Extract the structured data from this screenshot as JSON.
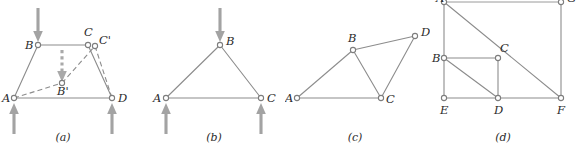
{
  "figure": {
    "kind": "statics-free-body-diagrams",
    "colors": {
      "line": "#8c8c8c",
      "node_stroke": "#7d7d7d",
      "node_fill": "#ffffff",
      "arrow": "#a3a3a3",
      "dashed_arrow": "#a9a9a9",
      "label": "#2b2b2b",
      "background": "#ffffff"
    },
    "panels": [
      {
        "id": "a",
        "caption": "(a)",
        "description": "Deformable quadrilateral frame ABCD with dashed deformed shape AB'C'D",
        "vertices": [
          {
            "name": "A",
            "label": "A",
            "x": 14,
            "y": 98
          },
          {
            "name": "B",
            "label": "B",
            "x": 38,
            "y": 45
          },
          {
            "name": "C",
            "label": "C",
            "x": 88,
            "y": 45
          },
          {
            "name": "D",
            "label": "D",
            "x": 112,
            "y": 98
          },
          {
            "name": "Bp",
            "label": "B'",
            "x": 62,
            "y": 83
          },
          {
            "name": "Cp",
            "label": "C'",
            "x": 95,
            "y": 45
          }
        ],
        "solid_edges": [
          "A-B",
          "B-C",
          "C-D",
          "A-D"
        ],
        "dashed_edges": [
          "A-Bp",
          "Bp-Cp",
          "Cp-D"
        ],
        "load_arrows": [
          {
            "name": "top-load-at-B",
            "direction": "down",
            "x": 38,
            "y_from": 8,
            "y_to": 40
          },
          {
            "name": "support-at-A",
            "direction": "up",
            "x": 14,
            "y_from": 134,
            "y_to": 103
          },
          {
            "name": "support-at-D",
            "direction": "up",
            "x": 112,
            "y_from": 134,
            "y_to": 103
          }
        ],
        "dashed_arrows": [
          {
            "name": "deflection-arrow-B-to-Bprime",
            "direction": "down",
            "x": 62,
            "y_from": 50,
            "y_to": 80
          }
        ]
      },
      {
        "id": "b",
        "caption": "(b)",
        "description": "Rigid triangular truss ABC with vertical load at B and supports at A and C",
        "vertices": [
          {
            "name": "A",
            "label": "A",
            "x": 18,
            "y": 98
          },
          {
            "name": "B",
            "label": "B",
            "x": 72,
            "y": 45
          },
          {
            "name": "C",
            "label": "C",
            "x": 113,
            "y": 98
          }
        ],
        "solid_edges": [
          "A-B",
          "B-C",
          "A-C"
        ],
        "dashed_edges": [],
        "load_arrows": [
          {
            "name": "top-load-at-B",
            "direction": "down",
            "x": 72,
            "y_from": 8,
            "y_to": 40
          },
          {
            "name": "support-at-A",
            "direction": "up",
            "x": 18,
            "y_from": 134,
            "y_to": 103
          },
          {
            "name": "support-at-C",
            "direction": "up",
            "x": 113,
            "y_from": 134,
            "y_to": 103
          }
        ],
        "dashed_arrows": []
      },
      {
        "id": "c",
        "caption": "(c)",
        "description": "Two-triangle truss ABC plus BCD sharing member BC",
        "vertices": [
          {
            "name": "A",
            "label": "A",
            "x": 12,
            "y": 98
          },
          {
            "name": "B",
            "label": "B",
            "x": 68,
            "y": 50
          },
          {
            "name": "C",
            "label": "C",
            "x": 96,
            "y": 98
          },
          {
            "name": "D",
            "label": "D",
            "x": 130,
            "y": 36
          }
        ],
        "solid_edges": [
          "A-B",
          "B-D",
          "D-C",
          "B-C",
          "A-C"
        ],
        "dashed_edges": [],
        "load_arrows": [],
        "dashed_arrows": []
      },
      {
        "id": "d",
        "caption": "(d)",
        "description": "Rectangular frame AEFG with interior members, partially clipped at top",
        "vertices": [
          {
            "name": "A",
            "label": "A",
            "x": 16,
            "y": 2
          },
          {
            "name": "G",
            "label": "G",
            "x": 133,
            "y": 2
          },
          {
            "name": "B",
            "label": "B",
            "x": 16,
            "y": 58
          },
          {
            "name": "C",
            "label": "C",
            "x": 70,
            "y": 58
          },
          {
            "name": "E",
            "label": "E",
            "x": 16,
            "y": 98
          },
          {
            "name": "D",
            "label": "D",
            "x": 70,
            "y": 98
          },
          {
            "name": "F",
            "label": "F",
            "x": 133,
            "y": 98
          }
        ],
        "solid_edges": [
          "A-G",
          "A-E",
          "G-F",
          "E-F",
          "B-C",
          "C-D",
          "B-D",
          "A-F"
        ],
        "dashed_edges": [],
        "load_arrows": [],
        "dashed_arrows": []
      }
    ]
  }
}
